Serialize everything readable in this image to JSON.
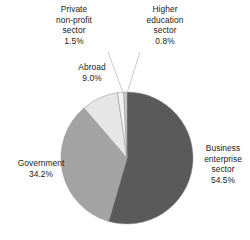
{
  "chart_data": {
    "type": "pie",
    "title": "",
    "subtitle": "",
    "xlabel": "",
    "ylabel": "",
    "legend_position": "none",
    "grid": false,
    "value_unit": "%",
    "start_angle_deg": 0,
    "direction": "clockwise",
    "categories": [
      "Business enterprise sector",
      "Government",
      "Abroad",
      "Private non-profit sector",
      "Higher education sector"
    ],
    "values": [
      54.5,
      34.2,
      9.0,
      1.5,
      0.8
    ],
    "slices": [
      {
        "key": "business",
        "name": "Business enterprise sector",
        "name_lines": [
          "Business",
          "enterprise",
          "sector"
        ],
        "value": 54.5,
        "value_label": "54.5%",
        "color": "#5a5a5a",
        "start_deg": 0,
        "end_deg": 196.2,
        "leader_line": false
      },
      {
        "key": "government",
        "name": "Government",
        "name_lines": [
          "Government"
        ],
        "value": 34.2,
        "value_label": "34.2%",
        "color": "#a3a3a3",
        "start_deg": 196.2,
        "end_deg": 319.32,
        "leader_line": false
      },
      {
        "key": "abroad",
        "name": "Abroad",
        "name_lines": [
          "Abroad"
        ],
        "value": 9.0,
        "value_label": "9.0%",
        "color": "#e6e6e6",
        "start_deg": 319.32,
        "end_deg": 351.72,
        "leader_line": false
      },
      {
        "key": "private_non_profit",
        "name": "Private non-profit sector",
        "name_lines": [
          "Private",
          "non-profit",
          "sector"
        ],
        "value": 1.5,
        "value_label": "1.5%",
        "color": "#f2f2f2",
        "start_deg": 351.72,
        "end_deg": 357.12,
        "leader_line": true
      },
      {
        "key": "higher_education",
        "name": "Higher education sector",
        "name_lines": [
          "Higher",
          "education",
          "sector"
        ],
        "value": 0.8,
        "value_label": "0.8%",
        "color": "#c9c9c9",
        "start_deg": 357.12,
        "end_deg": 360,
        "leader_line": true
      }
    ],
    "geometry": {
      "center_x": 127,
      "center_y": 158,
      "radius": 66
    },
    "colors": {
      "background": "#ffffff",
      "text": "#1a1a1a",
      "outline": "#8c8c8c",
      "leader": "#c4c4c4"
    }
  }
}
